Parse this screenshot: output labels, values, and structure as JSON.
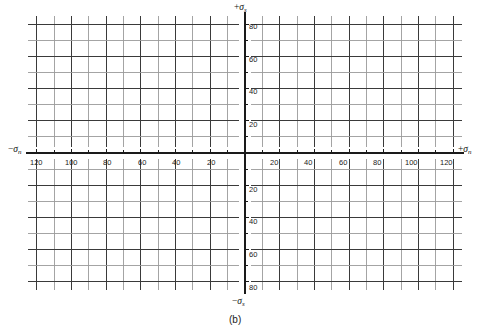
{
  "figure": {
    "caption": "(b)",
    "background_color": "#ffffff"
  },
  "axes": {
    "x_positive_label_sign": "+",
    "x_negative_label_sign": "−",
    "x_symbol": "σ",
    "x_subscript": "n",
    "y_positive_label_sign": "+",
    "y_negative_label_sign": "−",
    "y_symbol": "σ",
    "y_subscript": "s",
    "x_left_label": "−σn",
    "x_right_label": "+σn",
    "y_top_label": "+σs",
    "y_bottom_label": "−σs"
  },
  "ticks": {
    "x_left_labels": [
      "120",
      "100",
      "80",
      "60",
      "40",
      "20"
    ],
    "x_right_labels": [
      "20",
      "40",
      "60",
      "80",
      "100",
      "120"
    ],
    "y_top_labels": [
      "80",
      "60",
      "40",
      "20"
    ],
    "y_bottom_labels": [
      "20",
      "40",
      "60",
      "80"
    ]
  },
  "style": {
    "major_grid_color": "#3a3a3a",
    "minor_grid_color": "#9a9a9a",
    "axis_color": "#1a1a1a",
    "text_color": "#1a1a1a"
  },
  "chart_data": {
    "type": "line",
    "title": "",
    "subtitle": "",
    "xlabel": "σn",
    "ylabel": "σs",
    "xlim": [
      -125,
      125
    ],
    "ylim": [
      -88,
      88
    ],
    "grid": true,
    "legend": "none",
    "x_major_step": 20,
    "x_minor_step": 10,
    "y_major_step": 20,
    "y_minor_step": 10,
    "x_tick_values": [
      -120,
      -110,
      -100,
      -90,
      -80,
      -70,
      -60,
      -50,
      -40,
      -30,
      -20,
      -10,
      0,
      10,
      20,
      30,
      40,
      50,
      60,
      70,
      80,
      90,
      100,
      110,
      120
    ],
    "x_labeled_values": [
      -120,
      -100,
      -80,
      -60,
      -40,
      -20,
      20,
      40,
      60,
      80,
      100,
      120
    ],
    "y_tick_values": [
      -80,
      -70,
      -60,
      -50,
      -40,
      -30,
      -20,
      -10,
      0,
      10,
      20,
      30,
      40,
      50,
      60,
      70,
      80
    ],
    "y_labeled_values": [
      -80,
      -60,
      -40,
      -20,
      20,
      40,
      60,
      80
    ],
    "series": [],
    "annotations": [
      "(b)"
    ],
    "note": "Blank four-quadrant stress (Mohr diagram) graph paper; no data series plotted."
  }
}
